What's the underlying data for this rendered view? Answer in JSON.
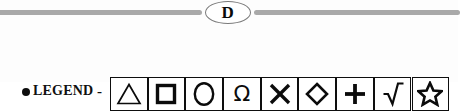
{
  "figure": {
    "divider": {
      "badge_letter": "D",
      "rule_color": "#a9a9a9",
      "badge_border_color": "#7a7a7a"
    },
    "legend": {
      "bullet": "●",
      "label": "LEGEND",
      "dash": "-",
      "symbols": [
        {
          "name": "triangle",
          "glyph": "△",
          "label": "triangle"
        },
        {
          "name": "square",
          "glyph": "□",
          "label": "square"
        },
        {
          "name": "circle",
          "glyph": "○",
          "label": "circle"
        },
        {
          "name": "omega",
          "glyph": "Ω",
          "label": "omega"
        },
        {
          "name": "cross-x",
          "glyph": "✕",
          "label": "x"
        },
        {
          "name": "diamond",
          "glyph": "◇",
          "label": "diamond"
        },
        {
          "name": "plus",
          "glyph": "＋",
          "label": "plus"
        },
        {
          "name": "radical",
          "glyph": "√",
          "label": "square-root"
        },
        {
          "name": "star",
          "glyph": "☆",
          "label": "star"
        }
      ]
    }
  }
}
